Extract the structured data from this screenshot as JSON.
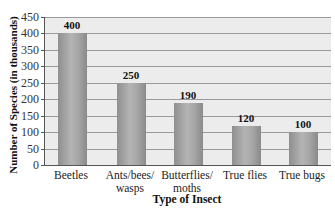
{
  "chart_data": {
    "type": "bar",
    "title": "",
    "xlabel": "Type of Insect",
    "ylabel": "Number of Species (in thousands)",
    "categories": [
      "Beetles",
      "Ants/bees/ wasps",
      "Butterflies/ moths",
      "True flies",
      "True bugs"
    ],
    "category_lines": [
      [
        "Beetles"
      ],
      [
        "Ants/bees/",
        "wasps"
      ],
      [
        "Butterflies/",
        "moths"
      ],
      [
        "True flies"
      ],
      [
        "True bugs"
      ]
    ],
    "values": [
      400,
      250,
      190,
      120,
      100
    ],
    "value_labels": [
      "400",
      "250",
      "190",
      "120",
      "100"
    ],
    "yticks": [
      0,
      50,
      100,
      150,
      200,
      250,
      300,
      350,
      400,
      450
    ],
    "ylim": [
      0,
      450
    ],
    "grid": true,
    "legend": null,
    "colors": {
      "bar": "#a0a0a0",
      "plot_bg": "#ececec",
      "grid": "#9a9a9a"
    }
  }
}
